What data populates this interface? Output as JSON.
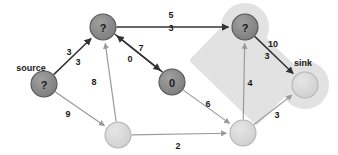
{
  "diagram": {
    "type": "directed-graph",
    "colors": {
      "node_dark": "#888888",
      "node_dark_stroke": "#555555",
      "node_light": "#d8d8d8",
      "node_light_stroke": "#b5b5b5",
      "edge_dark": "#333333",
      "edge_light": "#9a9a9a",
      "highlight": "#e0e0e0",
      "background": "#ffffff",
      "text": "#1a1a1a"
    },
    "highlight_region": {
      "name": "cut-highlight-capsule",
      "description": "light gray rounded capsule enclosing top-right node and sink node"
    },
    "nodes": [
      {
        "id": "source",
        "label": "?",
        "x": 44,
        "y": 84,
        "r": 13,
        "shade": "dark",
        "terminal": "source"
      },
      {
        "id": "top",
        "label": "?",
        "x": 103,
        "y": 27,
        "r": 13,
        "shade": "dark",
        "terminal": ""
      },
      {
        "id": "mid",
        "label": "0",
        "x": 172,
        "y": 82,
        "r": 13,
        "shade": "dark",
        "terminal": ""
      },
      {
        "id": "topright",
        "label": "?",
        "x": 245,
        "y": 27,
        "r": 13,
        "shade": "dark",
        "terminal": ""
      },
      {
        "id": "sink",
        "label": "",
        "x": 305,
        "y": 85,
        "r": 13,
        "shade": "light",
        "terminal": "sink"
      },
      {
        "id": "bottomleft",
        "label": "",
        "x": 118,
        "y": 135,
        "r": 13,
        "shade": "light",
        "terminal": ""
      },
      {
        "id": "bottomright",
        "label": "",
        "x": 243,
        "y": 133,
        "r": 13,
        "shade": "light",
        "terminal": ""
      }
    ],
    "terminal_labels": [
      {
        "name": "source-label",
        "text": "source",
        "x": 31,
        "y": 68
      },
      {
        "name": "sink-label",
        "text": "sink",
        "x": 303,
        "y": 63
      }
    ],
    "edges": [
      {
        "id": "source-top",
        "from": "source",
        "to": "top",
        "tone": "dark",
        "labels": [
          {
            "text": "3",
            "x": 69,
            "y": 52
          },
          {
            "text": "3",
            "x": 78,
            "y": 62
          }
        ]
      },
      {
        "id": "source-bottomleft",
        "from": "source",
        "to": "bottomleft",
        "tone": "light",
        "labels": [
          {
            "text": "9",
            "x": 68,
            "y": 114
          }
        ]
      },
      {
        "id": "top-topright",
        "from": "top",
        "to": "topright",
        "tone": "dark",
        "labels": [
          {
            "text": "5",
            "x": 171,
            "y": 15
          },
          {
            "text": "3",
            "x": 171,
            "y": 28
          }
        ]
      },
      {
        "id": "top-mid",
        "from": "top",
        "to": "mid",
        "tone": "dark",
        "labels": [
          {
            "text": "7",
            "x": 141,
            "y": 48
          }
        ]
      },
      {
        "id": "mid-top",
        "from": "mid",
        "to": "top",
        "tone": "dark",
        "labels": [
          {
            "text": "0",
            "x": 130,
            "y": 59
          }
        ]
      },
      {
        "id": "bottomleft-top",
        "from": "bottomleft",
        "to": "top",
        "tone": "light",
        "labels": [
          {
            "text": "8",
            "x": 94,
            "y": 82
          }
        ]
      },
      {
        "id": "mid-bottomright",
        "from": "mid",
        "to": "bottomright",
        "tone": "light",
        "labels": [
          {
            "text": "6",
            "x": 208,
            "y": 104
          }
        ]
      },
      {
        "id": "bottomleft-bottomright",
        "from": "bottomleft",
        "to": "bottomright",
        "tone": "light",
        "labels": [
          {
            "text": "2",
            "x": 178,
            "y": 146
          }
        ]
      },
      {
        "id": "bottomright-topright",
        "from": "bottomright",
        "to": "topright",
        "tone": "light",
        "labels": [
          {
            "text": "4",
            "x": 250,
            "y": 83
          }
        ]
      },
      {
        "id": "topright-sink",
        "from": "topright",
        "to": "sink",
        "tone": "dark",
        "labels": [
          {
            "text": "10",
            "x": 273,
            "y": 44
          },
          {
            "text": "3",
            "x": 267,
            "y": 56
          }
        ]
      },
      {
        "id": "bottomright-sink",
        "from": "bottomright",
        "to": "sink",
        "tone": "light",
        "labels": [
          {
            "text": "3",
            "x": 277,
            "y": 115
          }
        ]
      }
    ]
  }
}
